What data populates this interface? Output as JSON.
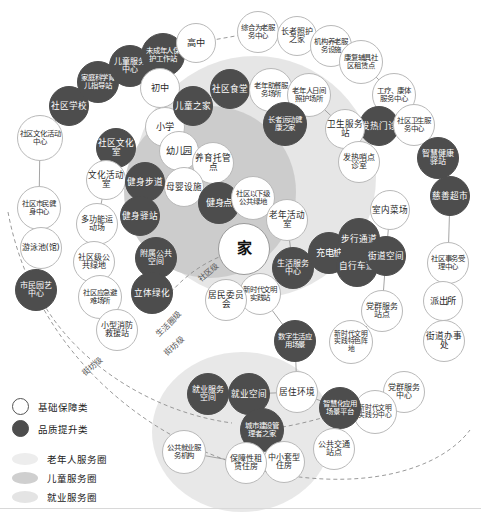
{
  "diagram": {
    "center": {
      "label": "家"
    },
    "ring_labels": [
      {
        "text": "社区级"
      },
      {
        "text": "生活圈级"
      },
      {
        "text": "街坊级"
      },
      {
        "text": "街坊级"
      }
    ],
    "legend": {
      "types": [
        {
          "key": "basic",
          "label": "基础保障类",
          "swatch": "circle-outline",
          "color": "#ffffff"
        },
        {
          "key": "quality",
          "label": "品质提升类",
          "swatch": "circle-filled",
          "color": "#4d4d4d"
        }
      ],
      "circles": [
        {
          "key": "elder",
          "label": "老年人服务圈",
          "color": "#ededed"
        },
        {
          "key": "child",
          "label": "儿童服务圈",
          "color": "#cfcfcf"
        },
        {
          "key": "job",
          "label": "就业服务圈",
          "color": "#e4e4e4"
        }
      ]
    },
    "nodes": [
      {
        "id": "n01",
        "label": "社区文化活动中心",
        "type": "basic",
        "x": 40,
        "y": 138,
        "r": 23
      },
      {
        "id": "n02",
        "label": "社区学校",
        "type": "quality",
        "x": 69,
        "y": 106,
        "r": 20
      },
      {
        "id": "n03",
        "label": "家庭科学育儿指导站",
        "type": "quality",
        "x": 98,
        "y": 82,
        "r": 21
      },
      {
        "id": "n04",
        "label": "儿童服务中心",
        "type": "quality",
        "x": 130,
        "y": 66,
        "r": 21
      },
      {
        "id": "n05",
        "label": "未成年人保护工作站",
        "type": "quality",
        "x": 163,
        "y": 55,
        "r": 22
      },
      {
        "id": "n06",
        "label": "高中",
        "type": "basic",
        "x": 196,
        "y": 43,
        "r": 20
      },
      {
        "id": "n07",
        "label": "初中",
        "type": "basic",
        "x": 160,
        "y": 88,
        "r": 20
      },
      {
        "id": "n08",
        "label": "小学",
        "type": "basic",
        "x": 165,
        "y": 127,
        "r": 20
      },
      {
        "id": "n09",
        "label": "儿童之家",
        "type": "quality",
        "x": 193,
        "y": 106,
        "r": 20
      },
      {
        "id": "n10",
        "label": "社区食堂",
        "type": "quality",
        "x": 230,
        "y": 89,
        "r": 20
      },
      {
        "id": "n11",
        "label": "综合为老服务中心",
        "type": "basic",
        "x": 258,
        "y": 32,
        "r": 21
      },
      {
        "id": "n12",
        "label": "长者照护之家",
        "type": "basic",
        "x": 297,
        "y": 36,
        "r": 20
      },
      {
        "id": "n13",
        "label": "机构养老服务设施",
        "type": "basic",
        "x": 331,
        "y": 46,
        "r": 21
      },
      {
        "id": "n14",
        "label": "康复辅具社区租赁点",
        "type": "basic",
        "x": 361,
        "y": 62,
        "r": 22
      },
      {
        "id": "n15",
        "label": "老年助餐服务场所",
        "type": "basic",
        "x": 271,
        "y": 90,
        "r": 22
      },
      {
        "id": "n16",
        "label": "老年人日间照护场所",
        "type": "basic",
        "x": 309,
        "y": 95,
        "r": 22
      },
      {
        "id": "n17",
        "label": "长者运动健康之家",
        "type": "quality",
        "x": 285,
        "y": 124,
        "r": 22
      },
      {
        "id": "n18",
        "label": "工疗、康体服务中心",
        "type": "basic",
        "x": 394,
        "y": 95,
        "r": 22
      },
      {
        "id": "n19",
        "label": "发热门诊",
        "type": "quality",
        "x": 379,
        "y": 126,
        "r": 20
      },
      {
        "id": "n20",
        "label": "社区卫生服务中心",
        "type": "basic",
        "x": 414,
        "y": 125,
        "r": 21
      },
      {
        "id": "n21",
        "label": "卫生服务站",
        "type": "basic",
        "x": 345,
        "y": 129,
        "r": 20
      },
      {
        "id": "n22",
        "label": "发热哨点诊室",
        "type": "basic",
        "x": 359,
        "y": 162,
        "r": 21
      },
      {
        "id": "n23",
        "label": "智慧健康驿站",
        "type": "quality",
        "x": 438,
        "y": 158,
        "r": 21
      },
      {
        "id": "n24",
        "label": "慈善超市",
        "type": "quality",
        "x": 450,
        "y": 196,
        "r": 20
      },
      {
        "id": "n25",
        "label": "幼儿园",
        "type": "basic",
        "x": 179,
        "y": 151,
        "r": 20
      },
      {
        "id": "n26",
        "label": "养育托管点",
        "type": "basic",
        "x": 213,
        "y": 163,
        "r": 21
      },
      {
        "id": "n27",
        "label": "母婴设施",
        "type": "basic",
        "x": 184,
        "y": 187,
        "r": 20
      },
      {
        "id": "n28",
        "label": "社区文化室",
        "type": "quality",
        "x": 116,
        "y": 148,
        "r": 20
      },
      {
        "id": "n29",
        "label": "文化活动室",
        "type": "basic",
        "x": 106,
        "y": 180,
        "r": 20
      },
      {
        "id": "n30",
        "label": "社区市民健身中心",
        "type": "basic",
        "x": 39,
        "y": 208,
        "r": 22
      },
      {
        "id": "n31",
        "label": "游泳池(馆)",
        "type": "basic",
        "x": 41,
        "y": 248,
        "r": 21
      },
      {
        "id": "n32",
        "label": "市民园艺中心",
        "type": "quality",
        "x": 36,
        "y": 290,
        "r": 21
      },
      {
        "id": "n33",
        "label": "多功能运动场",
        "type": "basic",
        "x": 97,
        "y": 224,
        "r": 21
      },
      {
        "id": "n34",
        "label": "社区级公共绿地",
        "type": "basic",
        "x": 94,
        "y": 262,
        "r": 21
      },
      {
        "id": "n35",
        "label": "社区应急避难场所",
        "type": "basic",
        "x": 100,
        "y": 297,
        "r": 22
      },
      {
        "id": "n36",
        "label": "小型消防救援站",
        "type": "basic",
        "x": 117,
        "y": 330,
        "r": 21
      },
      {
        "id": "n37",
        "label": "健身步道",
        "type": "quality",
        "x": 145,
        "y": 182,
        "r": 20
      },
      {
        "id": "n38",
        "label": "健身驿站",
        "type": "quality",
        "x": 140,
        "y": 216,
        "r": 20
      },
      {
        "id": "n39",
        "label": "附属公共空间",
        "type": "quality",
        "x": 156,
        "y": 258,
        "r": 21
      },
      {
        "id": "n40",
        "label": "立体绿化",
        "type": "quality",
        "x": 152,
        "y": 293,
        "r": 21
      },
      {
        "id": "n41",
        "label": "健身点",
        "type": "quality",
        "x": 219,
        "y": 203,
        "r": 21
      },
      {
        "id": "n42",
        "label": "社区以下级公共绿地",
        "type": "basic",
        "x": 253,
        "y": 198,
        "r": 22
      },
      {
        "id": "n43",
        "label": "老年活动室",
        "type": "basic",
        "x": 287,
        "y": 220,
        "r": 21
      },
      {
        "id": "n44",
        "label": "家",
        "type": "home",
        "x": 244,
        "y": 249,
        "r": 26
      },
      {
        "id": "n45",
        "label": "生活服务中心",
        "type": "quality",
        "x": 293,
        "y": 268,
        "r": 21
      },
      {
        "id": "n46",
        "label": "新时代文明实践站",
        "type": "basic",
        "x": 260,
        "y": 294,
        "r": 21
      },
      {
        "id": "n47",
        "label": "居民委员会",
        "type": "basic",
        "x": 226,
        "y": 300,
        "r": 21
      },
      {
        "id": "n48",
        "label": "数字生活应用场景",
        "type": "quality",
        "x": 295,
        "y": 341,
        "r": 21
      },
      {
        "id": "n49",
        "label": "新时代文明实践特色阵地",
        "type": "basic",
        "x": 351,
        "y": 342,
        "r": 22
      },
      {
        "id": "n50",
        "label": "充电桩",
        "type": "quality",
        "x": 329,
        "y": 253,
        "r": 21
      },
      {
        "id": "n51",
        "label": "步行通道",
        "type": "quality",
        "x": 359,
        "y": 239,
        "r": 21
      },
      {
        "id": "n52",
        "label": "自行车道",
        "type": "quality",
        "x": 357,
        "y": 266,
        "r": 21
      },
      {
        "id": "n53",
        "label": "街道空间",
        "type": "quality",
        "x": 386,
        "y": 256,
        "r": 20
      },
      {
        "id": "n54",
        "label": "室内菜场",
        "type": "basic",
        "x": 390,
        "y": 210,
        "r": 20
      },
      {
        "id": "n55",
        "label": "党群服务站点",
        "type": "basic",
        "x": 382,
        "y": 311,
        "r": 21
      },
      {
        "id": "n56",
        "label": "社区事务受理中心",
        "type": "basic",
        "x": 448,
        "y": 263,
        "r": 21
      },
      {
        "id": "n57",
        "label": "派出所",
        "type": "basic",
        "x": 443,
        "y": 301,
        "r": 20
      },
      {
        "id": "n58",
        "label": "街道办事处",
        "type": "basic",
        "x": 444,
        "y": 341,
        "r": 21
      },
      {
        "id": "n59",
        "label": "党群服务中心",
        "type": "basic",
        "x": 404,
        "y": 392,
        "r": 21
      },
      {
        "id": "n60",
        "label": "新时代文明实践分中心",
        "type": "basic",
        "x": 375,
        "y": 412,
        "r": 22
      },
      {
        "id": "n61",
        "label": "智慧化应用场景平台",
        "type": "quality",
        "x": 340,
        "y": 408,
        "r": 21
      },
      {
        "id": "n62",
        "label": "公共交通站点",
        "type": "basic",
        "x": 334,
        "y": 449,
        "r": 21
      },
      {
        "id": "n63",
        "label": "居住环境",
        "type": "basic",
        "x": 297,
        "y": 392,
        "r": 21
      },
      {
        "id": "n64",
        "label": "就业空间",
        "type": "quality",
        "x": 249,
        "y": 394,
        "r": 21
      },
      {
        "id": "n65",
        "label": "就业服务空间",
        "type": "quality",
        "x": 208,
        "y": 394,
        "r": 21
      },
      {
        "id": "n66",
        "label": "城市建设管理者之家",
        "type": "quality",
        "x": 262,
        "y": 430,
        "r": 22
      },
      {
        "id": "n67",
        "label": "中小套型住房",
        "type": "basic",
        "x": 284,
        "y": 462,
        "r": 21
      },
      {
        "id": "n68",
        "label": "保障性租赁住房",
        "type": "basic",
        "x": 246,
        "y": 463,
        "r": 21
      },
      {
        "id": "n69",
        "label": "公共就业服务机构",
        "type": "basic",
        "x": 184,
        "y": 452,
        "r": 22
      }
    ]
  }
}
